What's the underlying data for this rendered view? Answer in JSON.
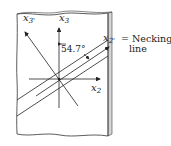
{
  "figure": {
    "type": "necking-band-diagram",
    "axes": {
      "x3": {
        "label": "x",
        "sub": "3"
      },
      "x2": {
        "label": "x",
        "sub": "2"
      },
      "x3_prime": {
        "label": "x",
        "sub": "3'"
      },
      "x2_prime": {
        "label": "x",
        "sub": "2'"
      }
    },
    "angle_label": "54.7°",
    "necking_label": "= Necking",
    "necking_label_line2": "line",
    "colors": {
      "stroke": "#222222",
      "plate_side": "#cfcfcf",
      "background": "#ffffff"
    }
  }
}
